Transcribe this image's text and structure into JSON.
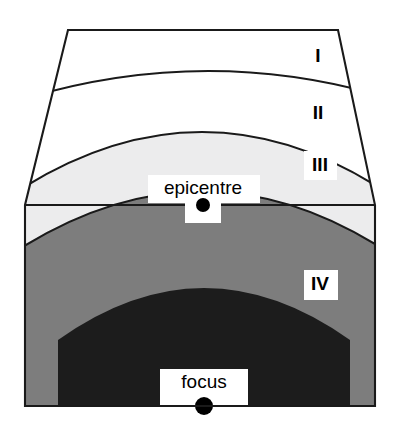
{
  "figure": {
    "kind": "seismic-intensity-zone-cross-section",
    "background_color": "#ffffff",
    "outline_color": "#1a1a1a"
  },
  "zones": [
    {
      "id": "zone-1",
      "label": "I",
      "label_x": 318,
      "label_y": 57,
      "fill": "#ffffff",
      "has_label_background": false
    },
    {
      "id": "zone-2",
      "label": "II",
      "label_x": 318,
      "label_y": 114,
      "fill": "#ffffff",
      "has_label_background": false
    },
    {
      "id": "zone-3",
      "label": "III",
      "label_x": 320,
      "label_y": 166,
      "fill": "#ececed",
      "has_label_background": true
    },
    {
      "id": "zone-4",
      "label": "IV",
      "label_x": 320,
      "label_y": 285,
      "fill": "#7d7d7d",
      "has_label_background": true
    },
    {
      "id": "zone-4-core",
      "label": "",
      "fill": "#1c1c1c",
      "has_label_background": false
    }
  ],
  "points": [
    {
      "id": "epicentre",
      "label": "epicentre",
      "label_x": 203,
      "label_y": 189,
      "dot_x": 203,
      "dot_y": 205,
      "dot_radius": 7,
      "dot_color": "#000000"
    },
    {
      "id": "focus",
      "label": "focus",
      "label_x": 204,
      "label_y": 383,
      "dot_x": 204,
      "dot_y": 406,
      "dot_radius": 9,
      "dot_color": "#000000"
    }
  ],
  "geometry": {
    "ground_line_y": 205,
    "top_edge_left_x": 68,
    "top_edge_right_x": 338,
    "top_edge_y": 30,
    "block_left_x": 25,
    "block_right_x": 375,
    "block_bottom_y": 406
  }
}
